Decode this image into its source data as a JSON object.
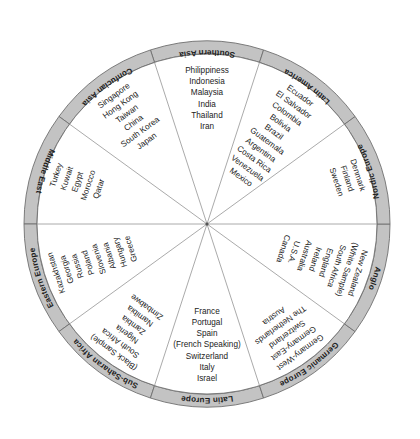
{
  "figure": {
    "shape": "circle",
    "ring_color": "#c3c3c3",
    "outline_color": "#6f6f6f",
    "text_color": "#222222",
    "background": "#ffffff"
  },
  "chart_data": {
    "type": "pie",
    "legend": "none",
    "grid": false,
    "categories": [
      "Southern Asia",
      "Latin America",
      "Nordic Europe",
      "Anglo",
      "Germanic Europe",
      "Latin Europe",
      "Sub-Saharan Africa",
      "Eastern Europe",
      "Middle East",
      "Confucian Asia"
    ],
    "values": [
      36,
      36,
      22,
      36,
      36,
      36,
      36,
      36,
      30,
      36
    ],
    "series": [
      {
        "name": "Southern Asia",
        "members": [
          "Philippiness",
          "Indonesia",
          "Malaysia",
          "India",
          "Thailand",
          "Iran"
        ]
      },
      {
        "name": "Latin America",
        "members": [
          "Ecuador",
          "El Salvador",
          "Colombia",
          "Bolivia",
          "Brazil",
          "Guatemala",
          "Argentina",
          "Costa Rica",
          "Venezuela",
          "Mexico"
        ]
      },
      {
        "name": "Nordic Europe",
        "members": [
          "Denmark",
          "Finland",
          "Sweden"
        ]
      },
      {
        "name": "Anglo",
        "members": [
          "Canada",
          "U.S.A.",
          "Australia",
          "Ireland",
          "England",
          "South Africa",
          "(White Sample)",
          "New Zealand"
        ]
      },
      {
        "name": "Germanic Europe",
        "members": [
          "Austria",
          "The Netherlands",
          "Switzerland",
          "Germany-East",
          "Germany-West"
        ]
      },
      {
        "name": "Latin Europe",
        "members": [
          "Israel",
          "Italy",
          "Switzerland",
          "(French Speaking)",
          "Spain",
          "Portugal",
          "France"
        ]
      },
      {
        "name": "Sub-Saharan Africa",
        "members": [
          "Zimbabwe",
          "Namibia",
          "Zambia",
          "Nigeria",
          "South Africa",
          "(Black Sample)"
        ]
      },
      {
        "name": "Eastern Europe",
        "members": [
          "Greece",
          "Hungary",
          "Albania",
          "Slovenia",
          "Poland",
          "Russia",
          "Georgia",
          "Kazakhstan"
        ]
      },
      {
        "name": "Middle East",
        "members": [
          "Turkey",
          "Kuwait",
          "Egypt",
          "Morocco",
          "Qatar"
        ]
      },
      {
        "name": "Confucian Asia",
        "members": [
          "Singapore",
          "Hong Kong",
          "Taiwan",
          "China",
          "South Korea",
          "Japan"
        ]
      }
    ]
  },
  "clusters": {
    "southern_asia": {
      "label": "Southern Asia",
      "countries": [
        "Philippiness",
        "Indonesia",
        "Malaysia",
        "India",
        "Thailand",
        "Iran"
      ]
    },
    "latin_america": {
      "label": "Latin America",
      "countries": [
        "Ecuador",
        "El Salvador",
        "Colombia",
        "Bolivia",
        "Brazil",
        "Guatemala",
        "Argentina",
        "Costa Rica",
        "Venezuela",
        "Mexico"
      ]
    },
    "nordic_europe": {
      "label": "Nordic Europe",
      "countries": [
        "Denmark",
        "Finland",
        "Sweden"
      ]
    },
    "anglo": {
      "label": "Anglo",
      "countries": [
        "Canada",
        "U.S.A.",
        "Australia",
        "Ireland",
        "England",
        "South Africa",
        "(White Sample)",
        "New Zealand"
      ]
    },
    "germanic_europe": {
      "label": "Germanic Europe",
      "countries": [
        "Austria",
        "The Netherlands",
        "Switzerland",
        "Germany-East",
        "Germany-West"
      ]
    },
    "latin_europe": {
      "label": "Latin Europe",
      "countries": [
        "Israel",
        "Italy",
        "Switzerland",
        "(French Speaking)",
        "Spain",
        "Portugal",
        "France"
      ]
    },
    "sub_saharan_africa": {
      "label": "Sub-Saharan Africa",
      "countries": [
        "Zimbabwe",
        "Namibia",
        "Zambia",
        "Nigeria",
        "South Africa",
        "(Black Sample)"
      ]
    },
    "eastern_europe": {
      "label": "Eastern Europe",
      "countries": [
        "Greece",
        "Hungary",
        "Albania",
        "Slovenia",
        "Poland",
        "Russia",
        "Georgia",
        "Kazakhstan"
      ]
    },
    "middle_east": {
      "label": "Middle East",
      "countries": [
        "Turkey",
        "Kuwait",
        "Egypt",
        "Morocco",
        "Qatar"
      ]
    },
    "confucian_asia": {
      "label": "Confucian Asia",
      "countries": [
        "Singapore",
        "Hong Kong",
        "Taiwan",
        "China",
        "South Korea",
        "Japan"
      ]
    }
  }
}
